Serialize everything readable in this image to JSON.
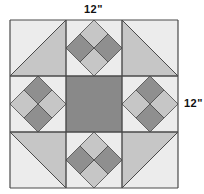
{
  "labels": {
    "width": "12\"",
    "height": "12\""
  },
  "block": {
    "name": "quilt-block",
    "grid": "3x3",
    "origin": [
      10,
      20
    ],
    "cell_size": 56,
    "colors": {
      "background": "#ececec",
      "light": "#c6c6c6",
      "dark": "#8f8f8f",
      "center": "#898989",
      "line": "#4a4a4a"
    },
    "cells": [
      {
        "pos": "top-left",
        "type": "half-square-triangle",
        "shaded": "bottom-right"
      },
      {
        "pos": "top-center",
        "type": "four-patch-on-point",
        "light": [
          "top",
          "bottom"
        ],
        "dark": [
          "left",
          "right"
        ]
      },
      {
        "pos": "top-right",
        "type": "half-square-triangle",
        "shaded": "bottom-left"
      },
      {
        "pos": "middle-left",
        "type": "four-patch-on-point",
        "light": [
          "left",
          "right"
        ],
        "dark": [
          "top",
          "bottom"
        ]
      },
      {
        "pos": "center",
        "type": "solid-square"
      },
      {
        "pos": "middle-right",
        "type": "four-patch-on-point",
        "light": [
          "left",
          "right"
        ],
        "dark": [
          "top",
          "bottom"
        ]
      },
      {
        "pos": "bottom-left",
        "type": "half-square-triangle",
        "shaded": "top-right"
      },
      {
        "pos": "bottom-center",
        "type": "four-patch-on-point",
        "light": [
          "top",
          "bottom"
        ],
        "dark": [
          "left",
          "right"
        ]
      },
      {
        "pos": "bottom-right",
        "type": "half-square-triangle",
        "shaded": "top-left"
      }
    ]
  }
}
